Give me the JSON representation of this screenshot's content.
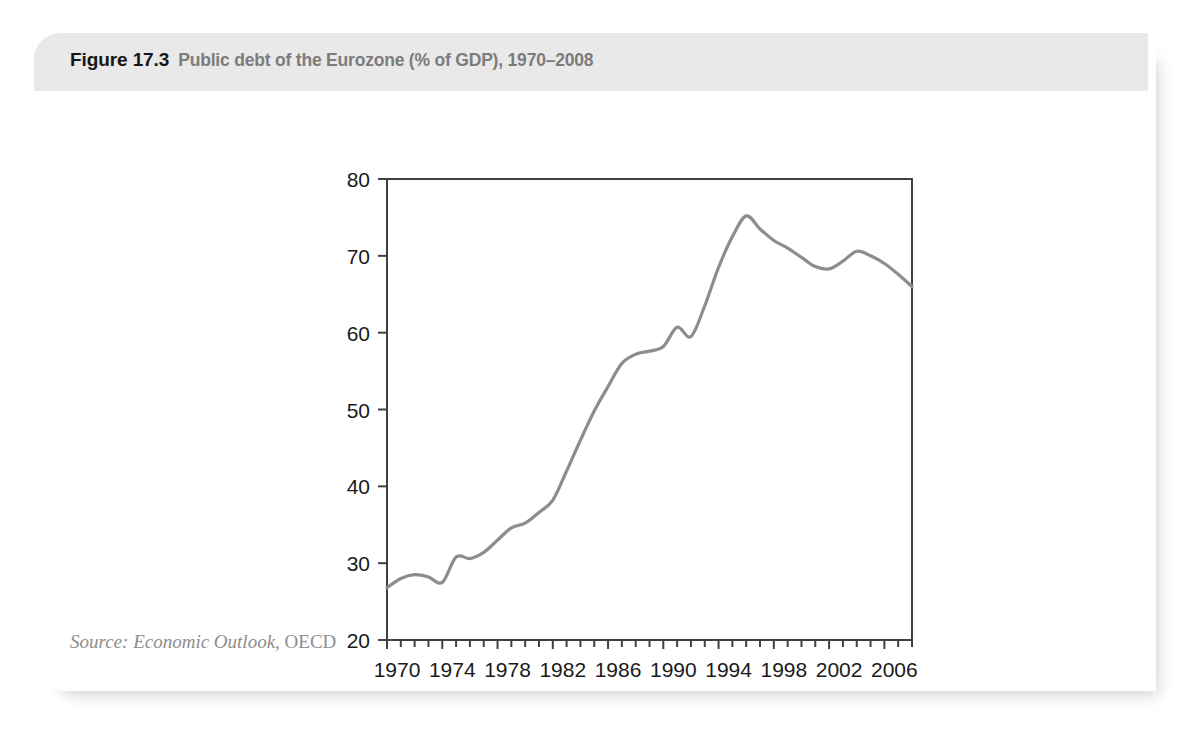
{
  "figure": {
    "number": "Figure 17.3",
    "title": "Public debt of the Eurozone (% of GDP), 1970–2008",
    "watermark": "",
    "source_prefix": "Source:",
    "source_italic": " Economic Outlook",
    "source_roman": ", OECD"
  },
  "colors": {
    "header_bg": "#e9e9e9",
    "card_bg": "#ffffff",
    "line": "#8d8d8d",
    "axis": "#404040",
    "tick_text": "#1a1a1a",
    "title_gray": "#7c7c7c",
    "source_gray": "#8d8d8d"
  },
  "chart_data": {
    "type": "line",
    "title": "Public debt of the Eurozone (% of GDP), 1970–2008",
    "xlabel": "",
    "ylabel": "",
    "xlim": [
      1970,
      2008
    ],
    "ylim": [
      20,
      80
    ],
    "yticks": [
      20,
      30,
      40,
      50,
      60,
      70,
      80
    ],
    "ytick_labels": [
      "20",
      "30",
      "40",
      "50",
      "60",
      "70",
      "80"
    ],
    "xticks": [
      1970,
      1974,
      1978,
      1982,
      1986,
      1990,
      1994,
      1998,
      2002,
      2006
    ],
    "xtick_labels": [
      "1970",
      "1974",
      "1978",
      "1982",
      "1986",
      "1990",
      "1994",
      "1998",
      "2002",
      "2006"
    ],
    "minor_xtick_interval": 1,
    "grid": false,
    "legend": null,
    "series": [
      {
        "name": "Public debt of the Eurozone (% of GDP)",
        "color": "#8d8d8d",
        "x": [
          1970,
          1971,
          1972,
          1973,
          1974,
          1975,
          1976,
          1977,
          1978,
          1979,
          1980,
          1981,
          1982,
          1983,
          1984,
          1985,
          1986,
          1987,
          1988,
          1989,
          1990,
          1991,
          1992,
          1993,
          1994,
          1995,
          1996,
          1997,
          1998,
          1999,
          2000,
          2001,
          2002,
          2003,
          2004,
          2005,
          2006,
          2007,
          2008
        ],
        "values": [
          26.8,
          28.0,
          28.5,
          28.2,
          27.5,
          30.8,
          30.6,
          31.4,
          33.0,
          34.6,
          35.2,
          36.6,
          38.2,
          42.0,
          46.0,
          49.8,
          53.0,
          56.0,
          57.2,
          57.6,
          58.2,
          60.7,
          59.5,
          63.5,
          68.5,
          72.5,
          75.2,
          73.5,
          72.0,
          71.0,
          69.8,
          68.6,
          68.3,
          69.3,
          70.6,
          70.0,
          69.0,
          67.6,
          66.0
        ]
      }
    ]
  }
}
